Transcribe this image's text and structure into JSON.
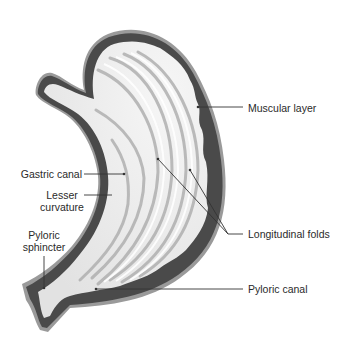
{
  "diagram": {
    "colors": {
      "background": "#ffffff",
      "muscle_wall": "#4a4a4a",
      "outer_serosa": "#9a9a9a",
      "mucosa_fill": "#ececec",
      "fold_shadow": "#b5b5b5",
      "leader_line": "#333333",
      "label_text": "#2a2a2a"
    },
    "labels": [
      {
        "id": "muscular-layer",
        "text": "Muscular layer",
        "side": "right"
      },
      {
        "id": "gastric-canal",
        "text": "Gastric canal",
        "side": "left"
      },
      {
        "id": "lesser-curvature",
        "line1": "Lesser",
        "line2": "curvature",
        "side": "left"
      },
      {
        "id": "pyloric-sphincter",
        "line1": "Pyloric",
        "line2": "sphincter",
        "side": "left"
      },
      {
        "id": "longitudinal-folds",
        "text": "Longitudinal folds",
        "side": "right"
      },
      {
        "id": "pyloric-canal",
        "text": "Pyloric canal",
        "side": "right"
      }
    ]
  }
}
